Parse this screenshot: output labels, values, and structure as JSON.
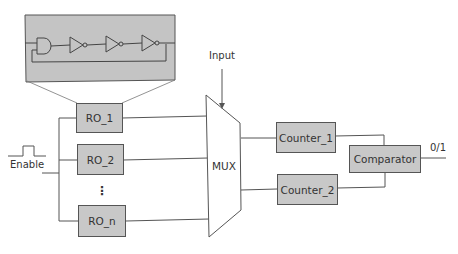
{
  "diagram": {
    "blocks": {
      "ro_1": "RO_1",
      "ro_2": "RO_2",
      "ro_dots": "⋮",
      "ro_n": "RO_n",
      "mux": "MUX",
      "counter_1": "Counter_1",
      "counter_2": "Counter_2",
      "comparator": "Comparator"
    },
    "labels": {
      "input": "Input",
      "enable": "Enable",
      "output": "0/1"
    },
    "inset": {
      "description": "Ring oscillator: AND gate followed by three inverters with feedback loop",
      "gates": [
        "AND",
        "NOT",
        "NOT",
        "NOT"
      ]
    },
    "colors": {
      "block_fill": "#c8c8c8",
      "line": "#555555",
      "inset_fill": "#c4c4c4"
    }
  }
}
